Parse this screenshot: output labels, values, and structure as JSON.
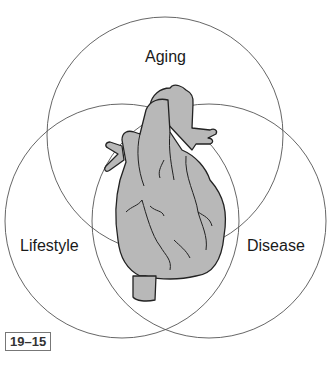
{
  "diagram": {
    "type": "venn",
    "sets": [
      {
        "label": "Aging",
        "position": "top"
      },
      {
        "label": "Lifestyle",
        "position": "left"
      },
      {
        "label": "Disease",
        "position": "right"
      }
    ],
    "center_illustration": "heart",
    "figure_number": "19–15"
  }
}
